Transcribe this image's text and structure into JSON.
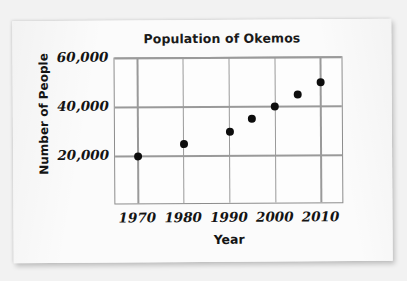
{
  "chart_data": {
    "type": "scatter",
    "title": "Population of Okemos",
    "xlabel": "Year",
    "ylabel": "Number of People",
    "xlim": [
      1965,
      2015
    ],
    "ylim": [
      0,
      60000
    ],
    "grid": true,
    "legend": "none",
    "xticks": [
      "1970",
      "1980",
      "1990",
      "2000",
      "2010"
    ],
    "xtick_values": [
      1970,
      1980,
      1990,
      2000,
      2010
    ],
    "yticks": [
      "20,000",
      "40,000",
      "60,000"
    ],
    "ytick_values": [
      20000,
      40000,
      60000
    ],
    "series": [
      {
        "name": "Population of Okemos",
        "marker": "filled-circle",
        "color": "#0d0d0d",
        "points": [
          {
            "x": 1970,
            "y": 20000
          },
          {
            "x": 1980,
            "y": 25000
          },
          {
            "x": 1990,
            "y": 30000
          },
          {
            "x": 1995,
            "y": 35000
          },
          {
            "x": 2000,
            "y": 40000
          },
          {
            "x": 2005,
            "y": 45000
          },
          {
            "x": 2010,
            "y": 50000
          }
        ]
      }
    ]
  },
  "style": {
    "paper_color": "#fbfbfb",
    "background_color": "#f2f2f2",
    "grid_color": "#9a9a9a",
    "axis_color": "#8c8c8c",
    "text_color": "#141414"
  }
}
